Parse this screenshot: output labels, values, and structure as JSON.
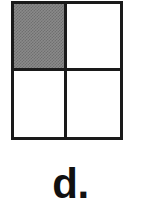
{
  "figure": {
    "kind": "fraction-area-model",
    "rows": 2,
    "columns": 2,
    "total_parts": 4,
    "shaded_parts": 1,
    "fraction_shaded": "1/4",
    "colors": {
      "outline": "#1a1a1a",
      "shaded_fill": "#808080",
      "unshaded_fill": "#ffffff",
      "background": "#ffffff",
      "label_text": "#111111"
    },
    "cells": [
      {
        "id": "cell-top-left",
        "row": 0,
        "column": 0,
        "shaded": true
      },
      {
        "id": "cell-top-right",
        "row": 0,
        "column": 1,
        "shaded": false
      },
      {
        "id": "cell-bottom-left",
        "row": 1,
        "column": 0,
        "shaded": false
      },
      {
        "id": "cell-bottom-right",
        "row": 1,
        "column": 1,
        "shaded": false
      }
    ]
  },
  "label": {
    "text": "d."
  }
}
